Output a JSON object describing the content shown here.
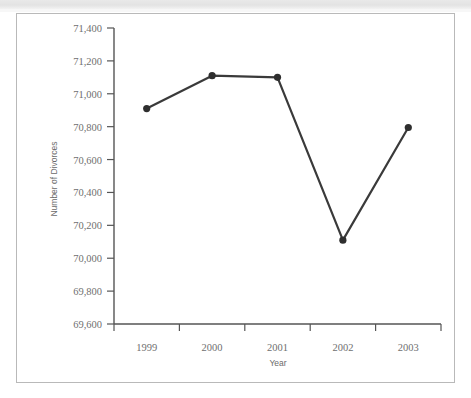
{
  "chart_data": {
    "type": "line",
    "title": "",
    "xlabel": "Year",
    "ylabel": "Number of Divorces",
    "categories": [
      "1999",
      "2000",
      "2001",
      "2002",
      "2003"
    ],
    "values": [
      70910,
      71110,
      71100,
      70110,
      70795
    ],
    "series": [
      {
        "name": "Number of Divorces",
        "values": [
          70910,
          71110,
          71100,
          70110,
          70795
        ]
      }
    ],
    "ylim": [
      69600,
      71400
    ],
    "yticks": [
      69600,
      69800,
      70000,
      70200,
      70400,
      70600,
      70800,
      71000,
      71200,
      71400
    ],
    "ytick_labels": [
      "69,600",
      "69,800",
      "70,000",
      "70,200",
      "70,400",
      "70,600",
      "70,800",
      "71,000",
      "71,200",
      "71,400"
    ],
    "xtick_labels": [
      "1999",
      "2000",
      "2001",
      "2002",
      "2003"
    ],
    "grid": false,
    "legend": null,
    "marker": "filled-circle",
    "line_color": "#3a3a3a",
    "marker_color": "#2e2e2e",
    "axis_color": "#555555",
    "text_color": "#6f6f6f",
    "background_color": "#ffffff",
    "frame_color": "#b9b9b9"
  }
}
